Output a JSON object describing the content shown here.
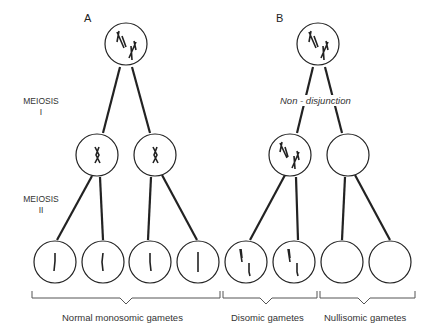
{
  "panels": {
    "a": {
      "label": "A"
    },
    "b": {
      "label": "B"
    }
  },
  "stages": {
    "meiosis_1": {
      "line1": "MEIOSIS",
      "line2": "I"
    },
    "meiosis_2": {
      "line1": "MEIOSIS",
      "line2": "II"
    }
  },
  "annotations": {
    "non_disjunction": "Non - disjunction"
  },
  "gamete_groups": [
    {
      "label": "Normal monosomic gametes",
      "count": 4,
      "chromosomes_per_gamete": 1
    },
    {
      "label": "Disomic gametes",
      "count": 2,
      "chromosomes_per_gamete": 2
    },
    {
      "label": "Nullisomic gametes",
      "count": 2,
      "chromosomes_per_gamete": 0
    }
  ],
  "colors": {
    "line": "#222222",
    "background": "#ffffff"
  }
}
